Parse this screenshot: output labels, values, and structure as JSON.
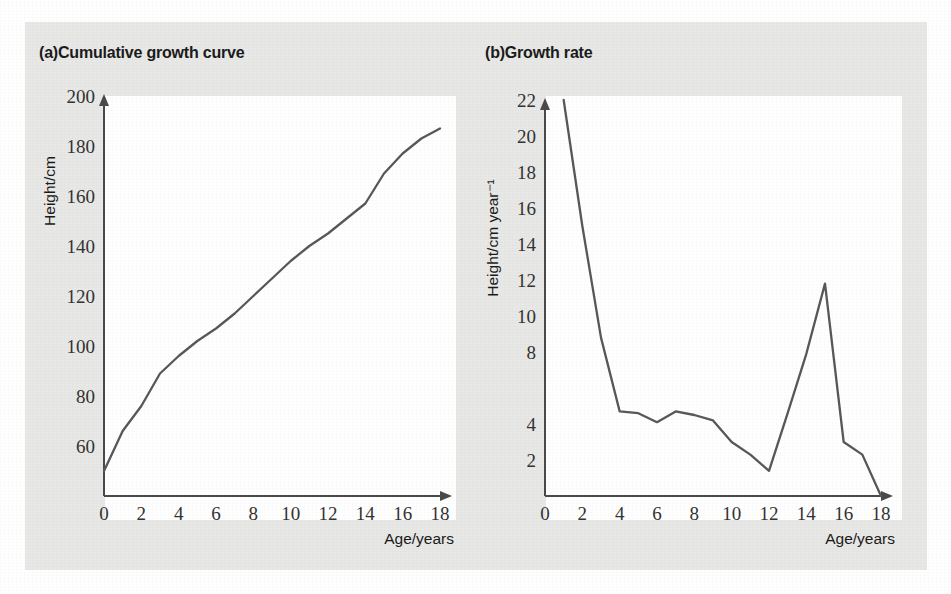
{
  "figure": {
    "background_color": "#e8e8e6",
    "plot_background_color": "#ffffff",
    "line_color": "#58585a",
    "axis_color": "#4a4a4a",
    "text_color": "#1b1b1b"
  },
  "panels": [
    {
      "key": "a",
      "title": "(a)Cumulative growth curve",
      "label": "(a)",
      "heading": "Cumulative growth curve"
    },
    {
      "key": "b",
      "title": "(b)Growth rate",
      "label": "(b)",
      "heading": "Growth rate"
    }
  ],
  "chart_data": [
    {
      "type": "line",
      "title": "(a)Cumulative growth curve",
      "xlabel": "Age/years",
      "ylabel": "Height/cm",
      "xlim": [
        0,
        18
      ],
      "ylim": [
        40,
        200
      ],
      "xticks": [
        0,
        2,
        4,
        6,
        8,
        10,
        12,
        14,
        16,
        18
      ],
      "xtick_labels": [
        "0",
        "2",
        "4",
        "6",
        "8",
        "10",
        "12",
        "14",
        "16",
        "18"
      ],
      "yticks": [
        60,
        80,
        100,
        120,
        140,
        160,
        180,
        200
      ],
      "ytick_labels": [
        "60",
        "80",
        "100",
        "120",
        "140",
        "160",
        "180",
        "200"
      ],
      "grid": false,
      "legend": false,
      "x": [
        0,
        1,
        2,
        3,
        4,
        5,
        6,
        7,
        8,
        9,
        10,
        11,
        12,
        13,
        14,
        15,
        16,
        17,
        18
      ],
      "values": [
        50,
        66,
        76,
        89,
        96,
        102,
        107,
        113,
        120,
        127,
        134,
        140,
        145,
        151,
        157,
        169,
        177,
        183,
        187
      ],
      "series": [
        {
          "name": "Height",
          "values": [
            50,
            66,
            76,
            89,
            96,
            102,
            107,
            113,
            120,
            127,
            134,
            140,
            145,
            151,
            157,
            169,
            177,
            183,
            187
          ]
        }
      ]
    },
    {
      "type": "line",
      "title": "(b)Growth rate",
      "xlabel": "Age/years",
      "ylabel": "Height/cm year⁻¹",
      "xlim": [
        0,
        18
      ],
      "ylim": [
        0,
        22
      ],
      "xticks": [
        0,
        2,
        4,
        6,
        8,
        10,
        12,
        14,
        16,
        18
      ],
      "xtick_labels": [
        "0",
        "2",
        "4",
        "6",
        "8",
        "10",
        "12",
        "14",
        "16",
        "18"
      ],
      "yticks": [
        2,
        4,
        8,
        10,
        12,
        14,
        16,
        18,
        20,
        22
      ],
      "ytick_labels": [
        "2",
        "4",
        "8",
        "10",
        "12",
        "14",
        "16",
        "18",
        "20",
        "22"
      ],
      "grid": false,
      "legend": false,
      "x": [
        1,
        2,
        3,
        4,
        5,
        6,
        7,
        8,
        9,
        10,
        11,
        12,
        13,
        14,
        15,
        16,
        17,
        18
      ],
      "values": [
        22,
        15,
        8.8,
        4.7,
        4.6,
        4.1,
        4.7,
        4.5,
        4.2,
        3.0,
        2.3,
        1.4,
        4.6,
        7.9,
        11.8,
        3.0,
        2.3,
        0
      ],
      "series": [
        {
          "name": "Growth rate",
          "values": [
            22,
            15,
            8.8,
            4.7,
            4.6,
            4.1,
            4.7,
            4.5,
            4.2,
            3.0,
            2.3,
            1.4,
            4.6,
            7.9,
            11.8,
            3.0,
            2.3,
            0
          ]
        }
      ]
    }
  ]
}
